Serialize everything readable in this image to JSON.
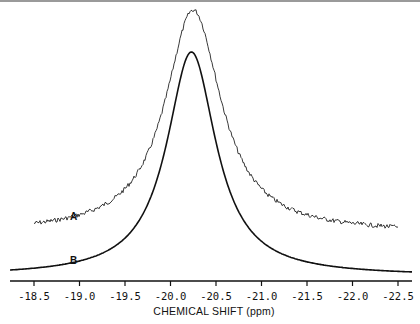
{
  "chart_data": {
    "type": "line",
    "title": "",
    "xlabel": "CHEMICAL SHIFT (ppm)",
    "ylabel": "",
    "xlim": [
      -18.35,
      -22.65
    ],
    "x_reversed": true,
    "x_ticks": [
      -18.5,
      -19.0,
      -19.5,
      -20.0,
      -20.5,
      -21.0,
      -21.5,
      -22.0,
      -22.5
    ],
    "x_tick_labels": [
      "-18.5",
      "-19.0",
      "-19.5",
      "-20.0",
      "-20.5",
      "-21.0",
      "-21.5",
      "-22.0",
      "-22.5"
    ],
    "grid": false,
    "legend": "inline labels",
    "series": [
      {
        "name": "A",
        "description": "experimental spectrum (noisy), offset vertically",
        "peak_ppm": -20.25,
        "peak_height_rel": 1.0,
        "baseline_rel": 0.19,
        "x_range": [
          -18.5,
          -22.5
        ]
      },
      {
        "name": "B",
        "description": "simulated Lorentzian lineshape",
        "peak_ppm": -20.23,
        "peak_height_rel": 0.86,
        "baseline_rel": 0.0,
        "x_range": [
          -18.35,
          -22.65
        ]
      }
    ]
  },
  "labels": {
    "series_a": "A",
    "series_b": "B",
    "xlabel": "CHEMICAL SHIFT (ppm)"
  },
  "axis": {
    "ticks": [
      "-18.5",
      "-19.0",
      "-19.5",
      "-20.0",
      "-20.5",
      "-21.0",
      "-21.5",
      "-22.0",
      "-22.5"
    ]
  },
  "colors": {
    "ink": "#111111",
    "background": "#ffffff",
    "top_rule": "#9a9a9a"
  }
}
